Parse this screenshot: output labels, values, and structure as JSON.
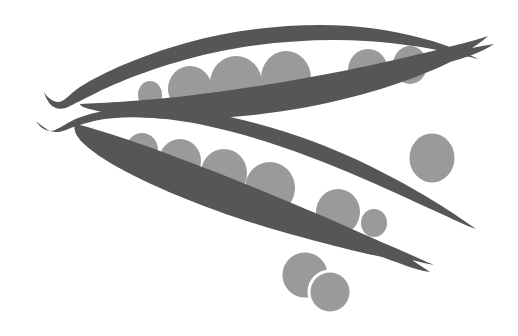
{
  "artwork": {
    "title": "Two open pea pods with peas",
    "subject": "pea-pods",
    "width": 518,
    "height": 336,
    "background_color": "#ffffff",
    "style": "flat grayscale silhouette illustration"
  },
  "palette": {
    "background": "#ffffff",
    "pod_dark": "#565656",
    "pea_gray": "#9a9a9a",
    "outline_white": "#ffffff"
  },
  "elements": {
    "upper_pod_label": "Upper pea pod",
    "lower_pod_label": "Lower pea pod",
    "loose_pea_right_label": "Loose pea right",
    "loose_pea_bottom_left_label": "Loose pea bottom left",
    "loose_pea_bottom_right_label": "Loose pea bottom right"
  },
  "counts": {
    "pods": 2,
    "peas_in_upper_pod": 6,
    "peas_in_lower_pod": 6,
    "loose_peas": 3,
    "total_peas": 15
  },
  "shapes": {
    "upper_pod_back": "M 44 92 C 48 99, 56 104, 62 101 C 68 98, 72 92, 80 87 C 104 72, 140 56, 186 43 C 246 26, 318 21, 370 28 C 408 33, 440 42, 462 52 C 468 54, 474 57, 478 59 C 470 57, 458 54, 448 52 C 424 47, 396 43, 366 41 C 318 38, 262 42, 212 53 C 164 64, 124 79, 96 93 C 84 99, 74 104, 68 107 C 62 110, 54 109, 50 104 C 47 100, 45 96, 44 92 Z",
    "upper_pod_front": "M 80 104 C 104 103, 140 101, 186 96 C 246 89, 316 77, 372 65 C 412 56, 446 48, 468 42 C 476 40, 482 38, 488 36 C 484 40, 478 44, 472 48 C 478 47, 486 45, 494 44 C 488 48, 480 52, 472 55 C 464 58, 456 60, 450 62 C 430 72, 398 85, 356 96 C 300 111, 232 120, 176 119 C 134 118, 102 113, 86 108 C 82 107, 80 105, 80 104 Z",
    "lower_pod_back": "M 36 121 C 40 128, 48 133, 55 130 C 62 127, 68 122, 78 118 C 104 108, 146 104, 196 111 C 254 119, 318 140, 370 166 C 410 186, 440 204, 460 218 C 466 222, 472 226, 476 229 C 468 226, 456 221, 446 216 C 422 205, 394 192, 364 179 C 316 158, 262 138, 212 127 C 164 116, 122 115, 94 121 C 82 124, 72 127, 66 130 C 59 133, 50 133, 45 128 C 41 125, 38 123, 36 121 Z",
    "lower_pod_front": "M 76 124 C 96 129, 128 139, 168 154 C 222 174, 286 200, 334 221 C 372 238, 400 250, 418 258 C 424 261, 430 263, 434 265 C 428 264, 420 262, 412 260 C 418 264, 424 268, 430 272 C 422 271, 412 268, 404 265 C 396 262, 388 259, 382 257 C 358 252, 322 243, 276 230 C 214 212, 154 188, 112 164 C 92 152, 80 142, 76 134 C 74 129, 74 125, 76 124 Z",
    "upper_peas": [
      {
        "name": "pea-u1",
        "cx": 150,
        "cy": 95,
        "rx": 12,
        "ry": 14
      },
      {
        "name": "pea-u2",
        "cx": 190,
        "cy": 89,
        "rx": 22,
        "ry": 23
      },
      {
        "name": "pea-u3",
        "cx": 236,
        "cy": 83,
        "rx": 26,
        "ry": 27
      },
      {
        "name": "pea-u4",
        "cx": 286,
        "cy": 78,
        "rx": 25,
        "ry": 27
      },
      {
        "name": "pea-u5",
        "cx": 368,
        "cy": 70,
        "rx": 20,
        "ry": 21
      },
      {
        "name": "pea-u6",
        "cx": 410,
        "cy": 65,
        "rx": 17,
        "ry": 19
      }
    ],
    "lower_peas": [
      {
        "name": "pea-l1",
        "cx": 142,
        "cy": 150,
        "rx": 16,
        "ry": 17
      },
      {
        "name": "pea-l2",
        "cx": 180,
        "cy": 161,
        "rx": 21,
        "ry": 22
      },
      {
        "name": "pea-l3",
        "cx": 224,
        "cy": 173,
        "rx": 23,
        "ry": 24
      },
      {
        "name": "pea-l4",
        "cx": 270,
        "cy": 188,
        "rx": 25,
        "ry": 26
      },
      {
        "name": "pea-l5",
        "cx": 338,
        "cy": 212,
        "rx": 22,
        "ry": 23
      },
      {
        "name": "pea-l6",
        "cx": 374,
        "cy": 223,
        "rx": 13,
        "ry": 14
      }
    ],
    "loose_peas": [
      {
        "name": "pea-loose-right",
        "cx": 432,
        "cy": 158,
        "rx": 24,
        "ry": 26
      },
      {
        "name": "pea-loose-bottom-left",
        "cx": 305,
        "cy": 275,
        "rx": 24,
        "ry": 24
      },
      {
        "name": "pea-loose-bottom-right",
        "cx": 330,
        "cy": 292,
        "rx": 21,
        "ry": 21
      }
    ]
  }
}
